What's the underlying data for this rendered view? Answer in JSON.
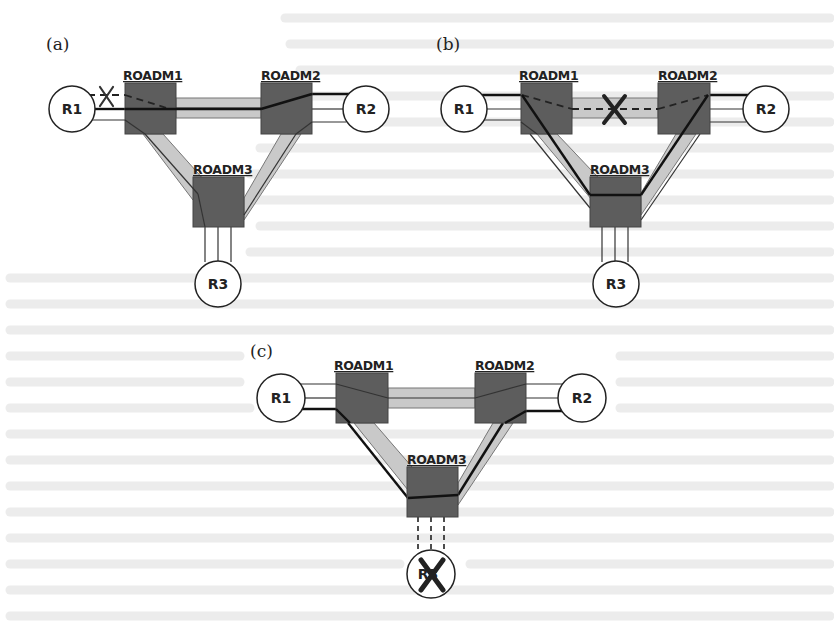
{
  "figure": {
    "colors": {
      "roadm_fill": "#5d5d5d",
      "fiber_fill": "#c9c9c9",
      "router_fill": "#ffffff",
      "line": "#111111",
      "background_bleed_text": "#ececec"
    }
  },
  "panels": [
    {
      "id": "a",
      "label": "(a)",
      "failure": "Link R1–ROADM1 failed (X on upper R1 link)",
      "routers": [
        {
          "label": "R1"
        },
        {
          "label": "R2"
        },
        {
          "label": "R3"
        }
      ],
      "roadms": [
        {
          "label": "ROADM1"
        },
        {
          "label": "ROADM2"
        },
        {
          "label": "ROADM3"
        }
      ],
      "failure_mark": "X"
    },
    {
      "id": "b",
      "label": "(b)",
      "failure": "Fiber ROADM1–ROADM2 failed; traffic rerouted via ROADM3",
      "routers": [
        {
          "label": "R1"
        },
        {
          "label": "R2"
        },
        {
          "label": "R3"
        }
      ],
      "roadms": [
        {
          "label": "ROADM1"
        },
        {
          "label": "ROADM2"
        },
        {
          "label": "ROADM3"
        }
      ],
      "failure_mark": "X"
    },
    {
      "id": "c",
      "label": "(c)",
      "failure": "Router R3 failed; its links shown dashed",
      "routers": [
        {
          "label": "R1"
        },
        {
          "label": "R2"
        },
        {
          "label": "R3"
        }
      ],
      "roadms": [
        {
          "label": "ROADM1"
        },
        {
          "label": "ROADM2"
        },
        {
          "label": "ROADM3"
        }
      ],
      "failure_mark": "X"
    }
  ]
}
